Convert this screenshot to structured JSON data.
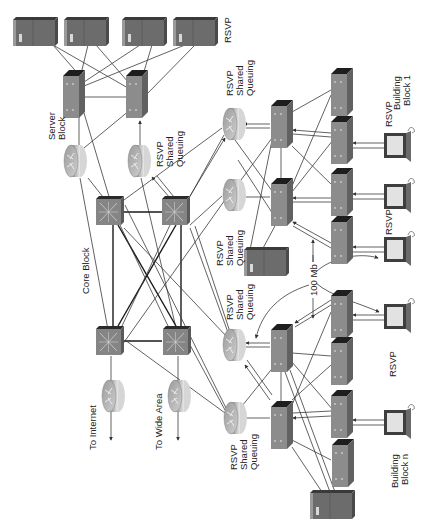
{
  "diagram": {
    "type": "network-topology",
    "orientation": "rotated-90-ccw",
    "labels": {
      "server_block": [
        "Server",
        "Block"
      ],
      "core_block": "Core Block",
      "to_internet": "To Internet",
      "to_wide_area": "To Wide Area",
      "rsvp_shared_queuing": [
        "RSVP",
        "Shared",
        "Queuing"
      ],
      "rsvp": "RSVP",
      "building_block_1": [
        "Building",
        "Block 1"
      ],
      "building_block_n": [
        "Building",
        "Block n"
      ],
      "bandwidth": "100 Mb"
    },
    "nodes": {
      "servers": [
        {
          "id": "server-1",
          "label": ""
        },
        {
          "id": "server-2",
          "label": ""
        },
        {
          "id": "server-3",
          "label": ""
        },
        {
          "id": "server-4",
          "label": ""
        },
        {
          "id": "server-bb1",
          "label": ""
        },
        {
          "id": "server-bbn",
          "label": ""
        }
      ],
      "routers": [
        {
          "id": "server-block-router-1",
          "label": ""
        },
        {
          "id": "server-block-router-2",
          "label": "RSVP Shared Queuing"
        },
        {
          "id": "internet-router",
          "label": "To Internet"
        },
        {
          "id": "wide-area-router",
          "label": "To Wide Area"
        },
        {
          "id": "bb1-router-1",
          "label": "RSVP Shared Queuing"
        },
        {
          "id": "bb1-router-2",
          "label": "RSVP Shared Queuing"
        },
        {
          "id": "bbn-router-1",
          "label": "RSVP Shared Queuing"
        },
        {
          "id": "bbn-router-2",
          "label": "RSVP Shared Queuing"
        }
      ],
      "core_switches": 4,
      "distribution_switches": 6,
      "access_switches": 8,
      "workstations": 5
    },
    "colors": {
      "device_face": "#8a8a8a",
      "device_dark": "#2a2a2a",
      "device_side": "#6e6e6e",
      "screen": "#e6e6e6",
      "line": "#3a3a3a"
    }
  }
}
